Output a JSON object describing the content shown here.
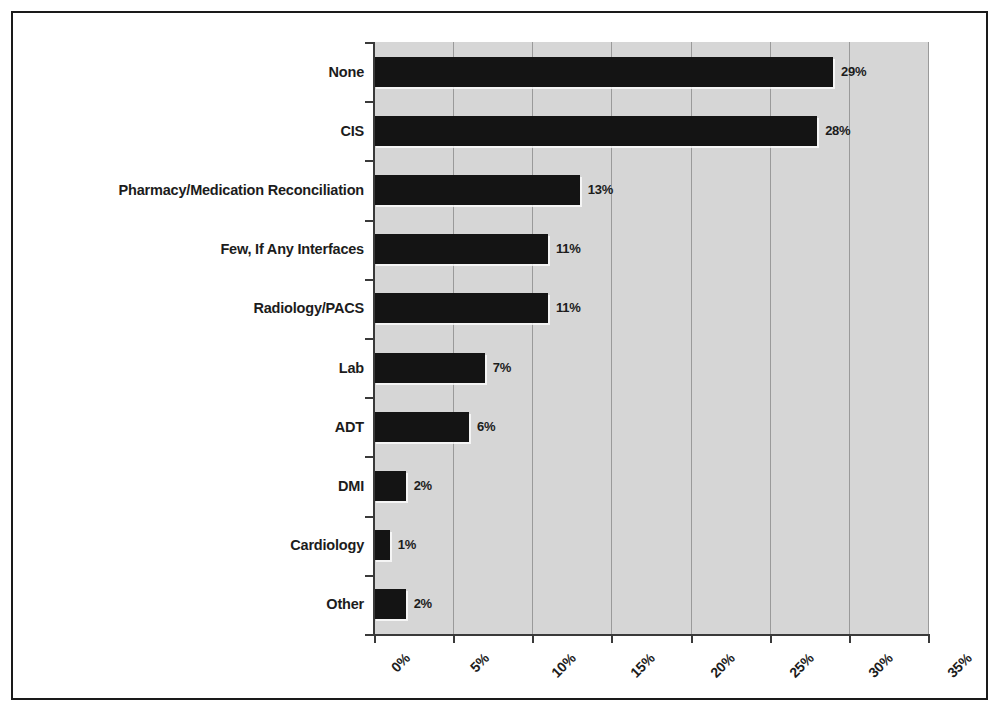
{
  "chart_data": {
    "type": "bar",
    "orientation": "horizontal",
    "title": "",
    "subtitle": "",
    "xlabel": "",
    "ylabel": "",
    "categories": [
      "None",
      "CIS",
      "Pharmacy/Medication Reconciliation",
      "Few, If Any Interfaces",
      "Radiology/PACS",
      "Lab",
      "ADT",
      "DMI",
      "Cardiology",
      "Other"
    ],
    "values": [
      29,
      28,
      13,
      11,
      11,
      7,
      6,
      2,
      1,
      2
    ],
    "data_labels": [
      "29%",
      "28%",
      "13%",
      "11%",
      "11%",
      "7%",
      "6%",
      "2%",
      "1%",
      "2%"
    ],
    "xlim": [
      0,
      35
    ],
    "xticks": [
      0,
      5,
      10,
      15,
      20,
      25,
      30,
      35
    ],
    "xtick_labels": [
      "0%",
      "5%",
      "10%",
      "15%",
      "20%",
      "25%",
      "30%",
      "35%"
    ],
    "grid": true,
    "grid_axis": "x",
    "legend": null,
    "bar_color": "#141414",
    "plot_background": "#d6d6d6",
    "figure_background": "#ffffff",
    "gridline_color": "#9a9a9a",
    "axis_color": "#3a3a3a"
  }
}
